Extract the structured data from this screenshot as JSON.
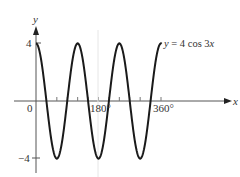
{
  "chart_data": {
    "type": "line",
    "title": "",
    "function_label": "y = 4 cos 3x",
    "xlabel": "x",
    "ylabel": "y",
    "x_unit": "degrees",
    "xlim": [
      0,
      400
    ],
    "ylim": [
      -4.5,
      5
    ],
    "x_tick_labels": [
      {
        "value": 0,
        "label": "0"
      },
      {
        "value": 180,
        "label": "180°"
      },
      {
        "value": 360,
        "label": "360°"
      }
    ],
    "x_minor_ticks": [
      30,
      60,
      90,
      120,
      150,
      210,
      240,
      270,
      300,
      330
    ],
    "y_tick_labels": [
      {
        "value": 4,
        "label": "4"
      },
      {
        "value": -4,
        "label": "−4"
      }
    ],
    "grid": false,
    "series": [
      {
        "name": "y = 4 cos 3x",
        "amplitude": 4,
        "frequency": 3,
        "x": [
          0,
          30,
          60,
          90,
          120,
          150,
          180,
          210,
          240,
          270,
          300,
          330,
          360
        ],
        "values": [
          4,
          0,
          -4,
          0,
          4,
          0,
          -4,
          0,
          4,
          0,
          -4,
          0,
          4
        ]
      }
    ]
  }
}
